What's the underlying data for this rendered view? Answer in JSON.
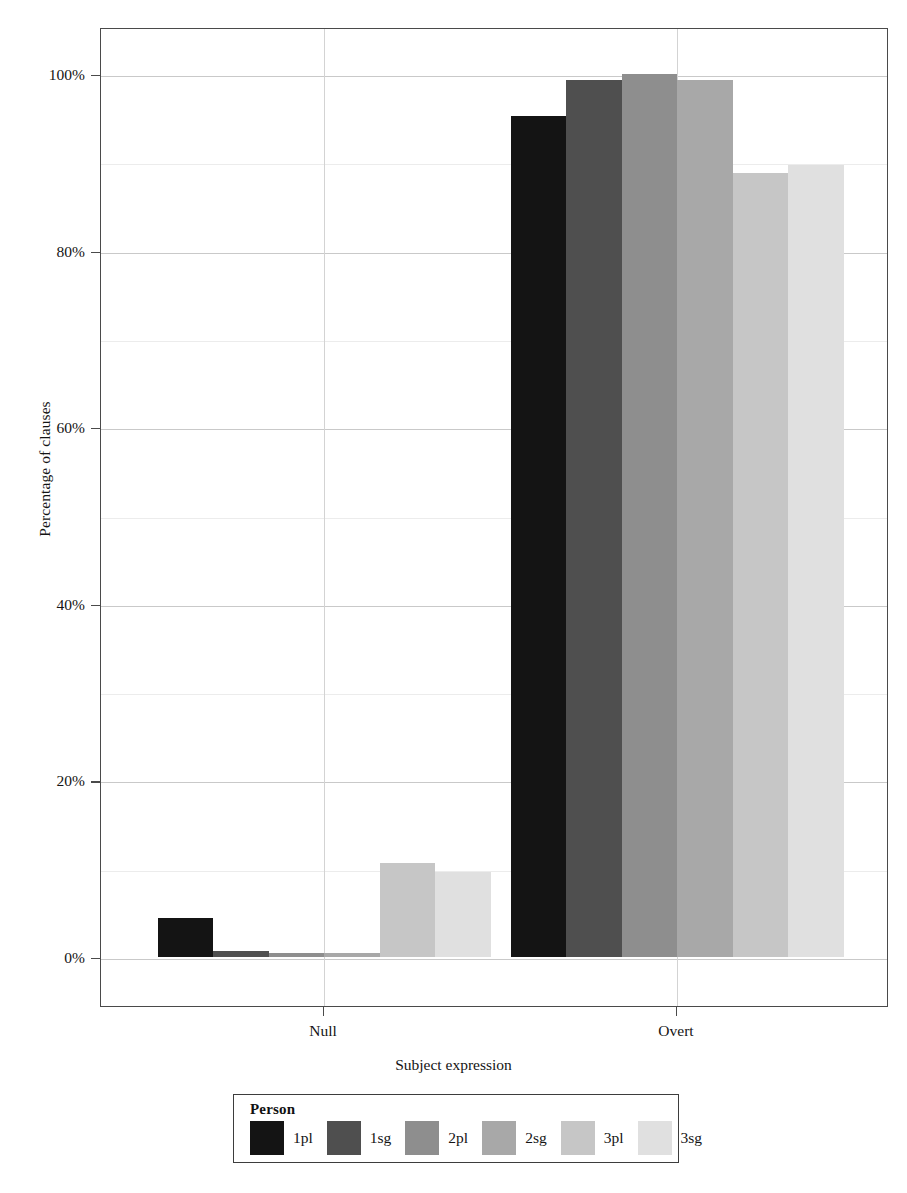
{
  "chart_data": {
    "type": "bar",
    "title": "",
    "xlabel": "Subject expression",
    "ylabel": "Percentage of clauses",
    "categories": [
      "Null",
      "Overt"
    ],
    "ylim": [
      0,
      100
    ],
    "ytick_labels": [
      "0%",
      "20%",
      "40%",
      "60%",
      "80%",
      "100%"
    ],
    "ytick_values": [
      0,
      20,
      40,
      60,
      80,
      100
    ],
    "grid": true,
    "legend_title": "Person",
    "legend_position": "bottom",
    "series": [
      {
        "name": "1pl",
        "color": "#141414",
        "values": [
          4.4,
          95.2
        ]
      },
      {
        "name": "1sg",
        "color": "#4f4f4f",
        "values": [
          0.7,
          99.3
        ]
      },
      {
        "name": "2pl",
        "color": "#8e8e8e",
        "values": [
          0.4,
          100.0
        ]
      },
      {
        "name": "2sg",
        "color": "#a8a8a8",
        "values": [
          0.5,
          99.3
        ]
      },
      {
        "name": "3pl",
        "color": "#c6c6c6",
        "values": [
          10.6,
          88.8
        ]
      },
      {
        "name": "3sg",
        "color": "#e0e0e0",
        "values": [
          9.6,
          89.7
        ]
      }
    ]
  },
  "axes": {
    "y_title": "Percentage of clauses",
    "x_title": "Subject expression",
    "y_labels": [
      "100%",
      "80%",
      "60%",
      "40%",
      "20%",
      "0%"
    ],
    "x_labels": [
      "Null",
      "Overt"
    ]
  },
  "legend": {
    "title": "Person",
    "entries": [
      "1pl",
      "1sg",
      "2pl",
      "2sg",
      "3pl",
      "3sg"
    ]
  },
  "colors": {
    "panel_border": "#4a4a4a",
    "gridline": "#c9c9c9",
    "background": "#ffffff",
    "text": "#141414"
  }
}
